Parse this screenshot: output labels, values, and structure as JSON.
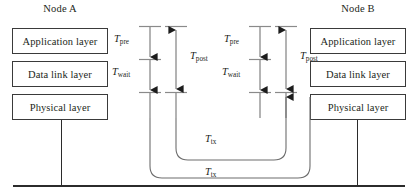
{
  "figure": {
    "kind": "protocol-timing-diagram",
    "nodes": [
      {
        "title": "Node A",
        "layers": [
          "Application layer",
          "Data link layer",
          "Physical layer"
        ]
      },
      {
        "title": "Node B",
        "layers": [
          "Application layer",
          "Data link layer",
          "Physical layer"
        ]
      }
    ],
    "timing_groups": [
      {
        "side": "A",
        "left_column": {
          "segments": [
            "T_pre",
            "T_wait"
          ]
        },
        "right_column": {
          "span": "T_post"
        }
      },
      {
        "side": "B",
        "left_column": {
          "segments": [
            "T_pre",
            "T_wait"
          ]
        },
        "right_column": {
          "span": "T_post"
        }
      }
    ],
    "links": [
      {
        "name": "inner-transmission-path",
        "label": "T_tx"
      },
      {
        "name": "outer-transmission-path",
        "label": "T_tx"
      }
    ]
  },
  "labels": {
    "node_a_title": "Node A",
    "node_b_title": "Node B",
    "application_layer": "Application layer",
    "data_link_layer": "Data link layer",
    "physical_layer": "Physical layer",
    "t_base": "T",
    "sub_pre": "pre",
    "sub_wait": "wait",
    "sub_post": "post",
    "sub_tx": "tx"
  },
  "colors": {
    "line": "#2b2b2b",
    "box_border": "#3a3a3a",
    "curve": "#6d6d6d",
    "arrow": "#8a8a8a",
    "arrow_head": "#1c1c1c",
    "text": "#231f20",
    "background": "#ffffff"
  }
}
